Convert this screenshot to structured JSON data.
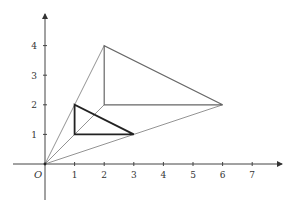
{
  "diagram": {
    "title": "",
    "type": "homothety",
    "origin_label": "O",
    "x_ticks": [
      "1",
      "2",
      "3",
      "4",
      "5",
      "6",
      "7"
    ],
    "y_ticks": [
      "1",
      "2",
      "3",
      "4"
    ],
    "center": [
      0,
      0
    ],
    "small_triangle": {
      "vertices": [
        [
          1,
          1
        ],
        [
          1,
          2
        ],
        [
          3,
          1
        ]
      ],
      "color": "#222222"
    },
    "large_triangle": {
      "vertices": [
        [
          2,
          2
        ],
        [
          2,
          4
        ],
        [
          6,
          2
        ]
      ],
      "color": "#666666"
    },
    "rays": [
      {
        "from": [
          0,
          0
        ],
        "to": [
          2,
          4
        ]
      },
      {
        "from": [
          0,
          0
        ],
        "to": [
          2,
          2
        ]
      },
      {
        "from": [
          0,
          0
        ],
        "to": [
          6,
          2
        ]
      }
    ],
    "colors": {
      "axis": "#444444",
      "ray": "#777777",
      "large_triangle": "#666666",
      "small_triangle": "#222222"
    }
  }
}
